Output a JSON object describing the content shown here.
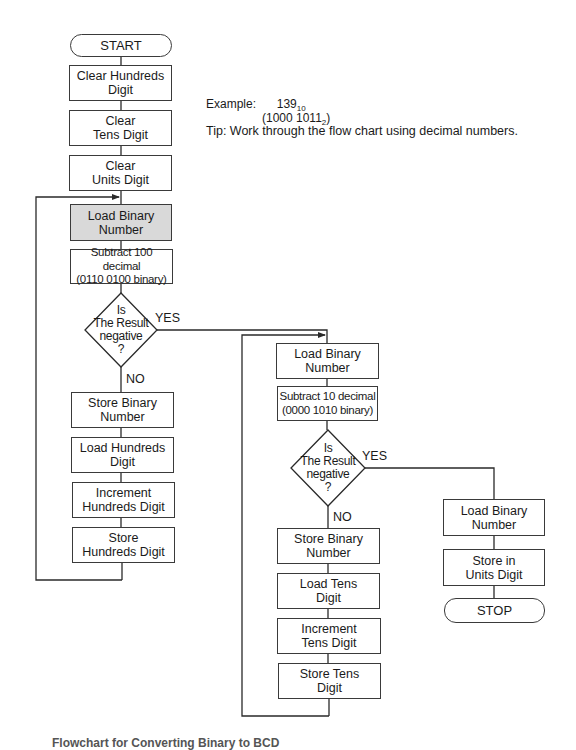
{
  "flowchart": {
    "left_column": {
      "start": "START",
      "clear_hundreds": "Clear Hundreds\nDigit",
      "clear_tens": "Clear\nTens Digit",
      "clear_units": "Clear\nUnits Digit",
      "load_binary": "Load Binary\nNumber",
      "subtract_100": "Subtract 100 decimal\n(0110 0100 binary)",
      "decision": "Is\nThe Result\nnegative\n?",
      "yes_label": "YES",
      "no_label": "NO",
      "store_binary": "Store Binary\nNumber",
      "load_hundreds": "Load Hundreds\nDigit",
      "increment_hundreds": "Increment\nHundreds Digit",
      "store_hundreds": "Store\nHundreds Digit"
    },
    "middle_column": {
      "load_binary": "Load Binary\nNumber",
      "subtract_10": "Subtract 10 decimal\n(0000 1010 binary)",
      "decision": "Is\nThe Result\nnegative\n?",
      "yes_label": "YES",
      "no_label": "NO",
      "store_binary": "Store Binary\nNumber",
      "load_tens": "Load Tens\nDigit",
      "increment_tens": "Increment\nTens Digit",
      "store_tens": "Store Tens\nDigit"
    },
    "right_column": {
      "load_binary": "Load Binary\nNumber",
      "store_units": "Store in\nUnits Digit",
      "stop": "STOP"
    }
  },
  "notes": {
    "example_label": "Example:",
    "example_decimal": "139",
    "example_decimal_base": "10",
    "example_binary": "(1000  1011",
    "example_binary_base": "2",
    "example_binary_close": ")",
    "tip": "Tip: Work through the flow chart using decimal numbers."
  },
  "caption": "Flowchart for Converting Binary to BCD"
}
